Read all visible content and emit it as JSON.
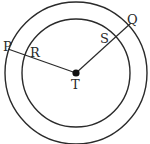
{
  "diagram": {
    "type": "concentric-circles",
    "center": {
      "label": "T",
      "x": 76,
      "y": 72
    },
    "outer_circle": {
      "r": 71
    },
    "inner_circle": {
      "r": 54
    },
    "segments": [
      {
        "from": "T",
        "to": "P",
        "through": "R"
      },
      {
        "from": "T",
        "to": "Q",
        "through": "S"
      }
    ],
    "points": {
      "P": {
        "label": "P",
        "x": 8,
        "y": 49
      },
      "R": {
        "label": "R",
        "x": 25,
        "y": 55
      },
      "Q": {
        "label": "Q",
        "x": 134,
        "y": 22
      },
      "S": {
        "label": "S",
        "x": 117,
        "y": 36
      },
      "T": {
        "label": "T",
        "x": 76,
        "y": 72
      }
    },
    "stroke_color": "#2a2a2a"
  }
}
